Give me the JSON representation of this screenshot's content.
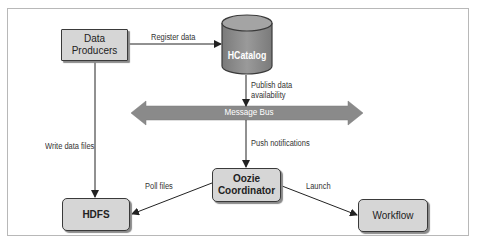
{
  "diagram": {
    "nodes": {
      "data_producers": {
        "line1": "Data",
        "line2": "Producers"
      },
      "hcatalog": {
        "label": "HCatalog",
        "shape": "cylinder"
      },
      "message_bus": {
        "label": "Message Bus",
        "shape": "double-arrow"
      },
      "oozie_coordinator": {
        "line1": "Oozie",
        "line2": "Coordinator"
      },
      "hdfs": {
        "label": "HDFS"
      },
      "workflow": {
        "label": "Workflow"
      }
    },
    "edges": {
      "register_data": {
        "from": "Data Producers",
        "to": "HCatalog",
        "label": "Register data"
      },
      "publish_availability": {
        "from": "HCatalog",
        "to": "Message Bus",
        "line1": "Publish data",
        "line2": "availability"
      },
      "push_notifications": {
        "from": "Message Bus",
        "to": "Oozie Coordinator",
        "label": "Push notifications"
      },
      "write_data_files": {
        "from": "Data Producers",
        "to": "HDFS",
        "label": "Write data files"
      },
      "poll_files": {
        "from": "Oozie Coordinator",
        "to": "HDFS",
        "label": "Poll files"
      },
      "launch": {
        "from": "Oozie Coordinator",
        "to": "Workflow",
        "label": "Launch"
      }
    },
    "colors": {
      "node_fill": "#d6d6d6",
      "node_border": "#3a3a3a",
      "cylinder_fill": "#8c8c8c",
      "bus_fill": "#8a8a8a",
      "edge": "#222222"
    }
  }
}
